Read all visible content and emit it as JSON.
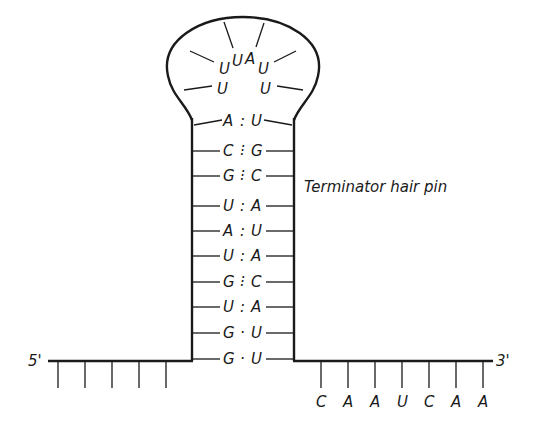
{
  "diagram": {
    "title": "Terminator hair pin",
    "five_prime_label": "5'",
    "three_prime_label": "3'",
    "loop": {
      "bases": [
        "U",
        "U",
        "U",
        "A",
        "U",
        "U"
      ]
    },
    "stem_pairs": [
      {
        "left": "A",
        "bond": ":",
        "right": "U"
      },
      {
        "left": "C",
        "bond": "⁝",
        "right": "G"
      },
      {
        "left": "G",
        "bond": "⁝",
        "right": "C"
      },
      {
        "left": "U",
        "bond": ":",
        "right": "A"
      },
      {
        "left": "A",
        "bond": ":",
        "right": "U"
      },
      {
        "left": "U",
        "bond": ":",
        "right": "A"
      },
      {
        "left": "G",
        "bond": "⁝",
        "right": "C"
      },
      {
        "left": "U",
        "bond": ":",
        "right": "A"
      },
      {
        "left": "G",
        "bond": "·",
        "right": "U"
      },
      {
        "left": "G",
        "bond": "·",
        "right": "U"
      }
    ],
    "upstream_ticks": 5,
    "downstream_bases": [
      "C",
      "A",
      "A",
      "U",
      "C",
      "A",
      "A"
    ]
  }
}
